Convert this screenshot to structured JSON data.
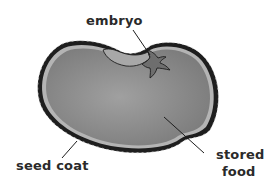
{
  "diagram": {
    "labels": {
      "embryo": "embryo",
      "seed_coat": "seed coat",
      "stored_food_line1": "stored",
      "stored_food_line2": "food"
    },
    "colors": {
      "seed_coat": "#1e1e1e",
      "stored_food": "#8a8a8a",
      "inner_rim": "#b4b4b4",
      "embryo_pocket": "#a8a8a8",
      "embryo": "#6e6e6e"
    }
  }
}
